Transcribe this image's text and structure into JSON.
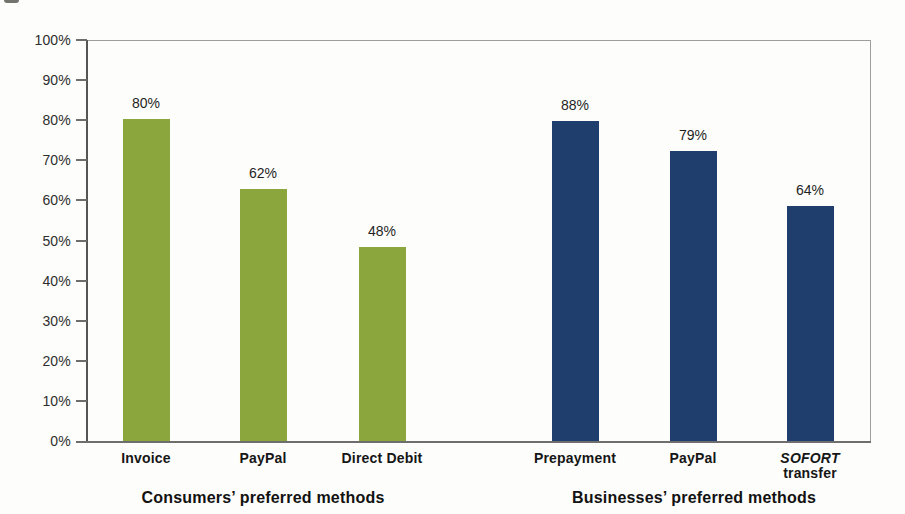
{
  "chart_data": {
    "type": "bar",
    "title": "",
    "xlabel": "",
    "ylabel": "",
    "ylim": [
      0,
      100
    ],
    "grid": "none",
    "legend": "none",
    "y_ticks": [
      "100%",
      "90%",
      "80%",
      "70%",
      "60%",
      "50%",
      "40%",
      "30%",
      "20%",
      "10%",
      "0%"
    ],
    "groups": [
      {
        "title": "Consumers’ preferred methods",
        "bar_color": "#8aa63c",
        "bars": [
          {
            "category": "Invoice",
            "category_lines": [
              {
                "text": "Invoice",
                "italic": false
              }
            ],
            "value": 80,
            "label": "80%",
            "drawn_percent": 80.2
          },
          {
            "category": "PayPal",
            "category_lines": [
              {
                "text": "PayPal",
                "italic": false
              }
            ],
            "value": 62,
            "label": "62%",
            "drawn_percent": 62.8
          },
          {
            "category": "Direct Debit",
            "category_lines": [
              {
                "text": "Direct Debit",
                "italic": false
              }
            ],
            "value": 48,
            "label": "48%",
            "drawn_percent": 48.4
          }
        ]
      },
      {
        "title": "Businesses’ preferred methods",
        "bar_color": "#203e6d",
        "bars": [
          {
            "category": "Prepayment",
            "category_lines": [
              {
                "text": "Prepayment",
                "italic": false
              }
            ],
            "value": 88,
            "label": "88%",
            "drawn_percent": 79.8
          },
          {
            "category": "PayPal",
            "category_lines": [
              {
                "text": "PayPal",
                "italic": false
              }
            ],
            "value": 79,
            "label": "79%",
            "drawn_percent": 72.2
          },
          {
            "category": "SOFORT transfer",
            "category_lines": [
              {
                "text": "SOFORT",
                "italic": true
              },
              {
                "text": "transfer",
                "italic": false
              }
            ],
            "value": 64,
            "label": "64%",
            "drawn_percent": 58.6
          }
        ]
      }
    ],
    "layout": {
      "plot": {
        "left": 88,
        "top": 40,
        "width": 783,
        "height": 401
      },
      "bar_width": 47,
      "bar_centers": [
        [
          146,
          263,
          382
        ],
        [
          575,
          693,
          810
        ]
      ],
      "tick_length": 11,
      "category_label_top": 451,
      "group_title_top": 489,
      "group_title_centers": [
        263,
        694
      ]
    }
  }
}
